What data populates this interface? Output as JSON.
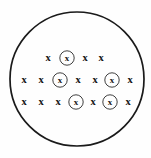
{
  "figure": {
    "background_color": "#fefefe",
    "line_color": "#1a1a1a",
    "glyph_color": "#141414",
    "boundary": {
      "shape": "circle",
      "center_x": 77,
      "center_y": 79,
      "radius": 67,
      "stroke_width": 1.7
    },
    "glyph_symbol": "x",
    "ring_radius": 7.2,
    "rows": [
      {
        "row_index": 1,
        "y": 58,
        "markers": [
          {
            "x": 48,
            "symbol": "x",
            "ringed": false
          },
          {
            "x": 67,
            "symbol": "x",
            "ringed": true
          },
          {
            "x": 85,
            "symbol": "x",
            "ringed": false
          },
          {
            "x": 101,
            "symbol": "x",
            "ringed": false
          }
        ]
      },
      {
        "row_index": 2,
        "y": 80,
        "markers": [
          {
            "x": 24,
            "symbol": "x",
            "ringed": false
          },
          {
            "x": 41,
            "symbol": "x",
            "ringed": false
          },
          {
            "x": 60,
            "symbol": "x",
            "ringed": true
          },
          {
            "x": 78,
            "symbol": "x",
            "ringed": false
          },
          {
            "x": 95,
            "symbol": "x",
            "ringed": false
          },
          {
            "x": 112,
            "symbol": "x",
            "ringed": true
          },
          {
            "x": 130,
            "symbol": "x",
            "ringed": false
          }
        ]
      },
      {
        "row_index": 3,
        "y": 102,
        "markers": [
          {
            "x": 24,
            "symbol": "x",
            "ringed": false
          },
          {
            "x": 41,
            "symbol": "x",
            "ringed": false
          },
          {
            "x": 58,
            "symbol": "x",
            "ringed": false
          },
          {
            "x": 76,
            "symbol": "x",
            "ringed": true
          },
          {
            "x": 93,
            "symbol": "x",
            "ringed": false
          },
          {
            "x": 110,
            "symbol": "x",
            "ringed": true
          },
          {
            "x": 128,
            "symbol": "x",
            "ringed": false
          }
        ]
      }
    ]
  },
  "chart_data": {
    "type": "scatter",
    "xlabel": "",
    "ylabel": "",
    "grid": false,
    "legend": null,
    "annotations": [],
    "boundary_shape": "circle",
    "boundary_center": [
      77,
      79
    ],
    "boundary_radius": 67,
    "series": [
      {
        "name": "field-marker-plain",
        "symbol": "x",
        "x": [
          48,
          85,
          101,
          24,
          41,
          78,
          95,
          130,
          24,
          41,
          58,
          93,
          128
        ],
        "y": [
          58,
          58,
          58,
          80,
          80,
          80,
          80,
          80,
          102,
          102,
          102,
          102,
          102
        ]
      },
      {
        "name": "field-marker-circled",
        "symbol": "circled-x",
        "x": [
          67,
          60,
          112,
          76,
          110
        ],
        "y": [
          58,
          80,
          80,
          102,
          102
        ]
      }
    ],
    "counts": {
      "row_1_total": 4,
      "row_2_total": 7,
      "row_3_total": 7,
      "plain_total": 13,
      "circled_total": 5,
      "grand_total": 18
    }
  }
}
